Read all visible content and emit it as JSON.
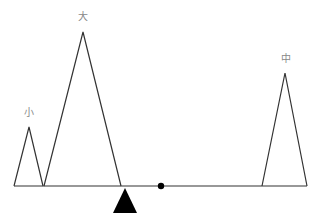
{
  "diagram": {
    "beam": {
      "x1": 14,
      "x2": 307,
      "y": 186
    },
    "fulcrum": {
      "apex_x": 125,
      "apex_y": 188,
      "base_left": 113,
      "base_right": 137,
      "base_y": 213,
      "color": "#000000"
    },
    "pivot_dot": {
      "x": 161,
      "y": 186,
      "r": 3
    },
    "weights": [
      {
        "label": "小",
        "left": 14,
        "apex_x": 29,
        "apex_y": 127,
        "right": 43,
        "label_x": 29,
        "label_y": 108
      },
      {
        "label": "大",
        "left": 44,
        "apex_x": 83,
        "apex_y": 32,
        "right": 121,
        "label_x": 83,
        "label_y": 12
      },
      {
        "label": "中",
        "left": 262,
        "apex_x": 285,
        "apex_y": 73,
        "right": 307,
        "label_x": 286,
        "label_y": 54
      }
    ]
  }
}
